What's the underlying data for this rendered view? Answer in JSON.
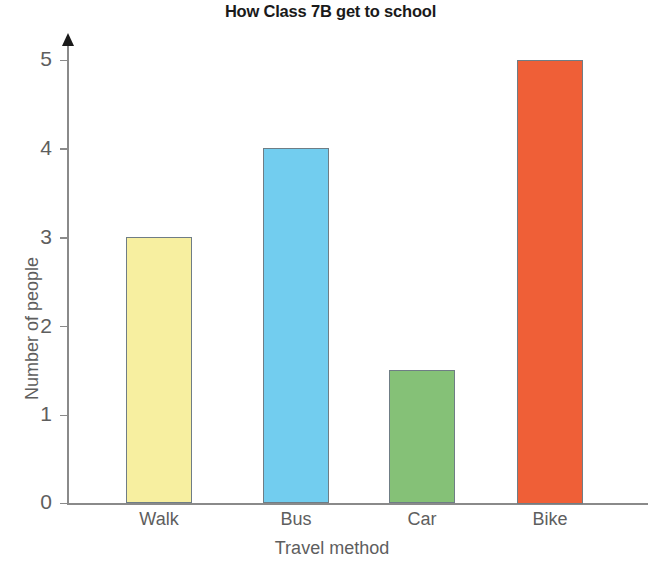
{
  "chart_data": {
    "type": "bar",
    "title": "How Class 7B get to school",
    "xlabel": "Travel method",
    "ylabel": "Number of people",
    "categories": [
      "Walk",
      "Bus",
      "Car",
      "Bike"
    ],
    "values": [
      3,
      4,
      1.5,
      5
    ],
    "ylim": [
      0,
      5
    ],
    "yticks": [
      "0",
      "1",
      "2",
      "3",
      "4",
      "5"
    ],
    "grid": false,
    "legend": "none",
    "bar_colors": [
      "#f7efa0",
      "#72cdef",
      "#85c177",
      "#ef5f37"
    ],
    "bar_outline_color": "#6f7d85",
    "axis_color": "#8a8a8a",
    "label_color": "#5e5e5e",
    "title_color": "#1a1a1a"
  }
}
